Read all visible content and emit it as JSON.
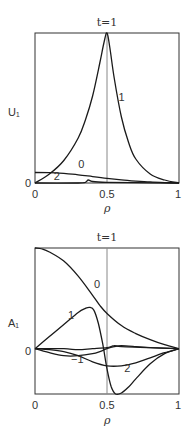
{
  "chart_data": [
    {
      "type": "line",
      "title": "t=1",
      "xlabel": "ρ",
      "ylabel": "U₁",
      "xlim": [
        0,
        1
      ],
      "ylim": [
        0,
        1
      ],
      "xticks": [
        "0",
        "0.5",
        "1"
      ],
      "yticks": [
        "0"
      ],
      "reference_line_x": 0.5,
      "grid": false,
      "series": [
        {
          "name": "1",
          "x": [
            0,
            0.1,
            0.2,
            0.3,
            0.35,
            0.4,
            0.45,
            0.48,
            0.5,
            0.52,
            0.55,
            0.6,
            0.65,
            0.7,
            0.8,
            0.9,
            1.0
          ],
          "y": [
            0,
            0.06,
            0.15,
            0.3,
            0.42,
            0.58,
            0.8,
            0.94,
            1.0,
            0.9,
            0.7,
            0.44,
            0.27,
            0.16,
            0.06,
            0.02,
            0
          ]
        },
        {
          "name": "0",
          "x": [
            0,
            0.1,
            0.2,
            0.3,
            0.4,
            0.5,
            0.6,
            0.7,
            0.8,
            0.9,
            1.0
          ],
          "y": [
            0.07,
            0.069,
            0.064,
            0.055,
            0.043,
            0.031,
            0.021,
            0.013,
            0.007,
            0.003,
            0
          ]
        },
        {
          "name": "2",
          "x": [
            0,
            0.3,
            0.35,
            0.37,
            0.4,
            0.5,
            0.7,
            1.0
          ],
          "y": [
            0,
            0,
            0.005,
            0.02,
            0.01,
            0.005,
            0.002,
            0
          ]
        }
      ],
      "annotations": [
        {
          "text": "1",
          "x": 0.58,
          "y": 0.55
        },
        {
          "text": "0",
          "x": 0.3,
          "y": 0.1
        },
        {
          "text": "2",
          "x": 0.13,
          "y": 0.02
        }
      ]
    },
    {
      "type": "line",
      "title": "t=1",
      "xlabel": "ρ",
      "ylabel": "A₁",
      "xlim": [
        0,
        1
      ],
      "ylim": [
        -0.45,
        1
      ],
      "xticks": [
        "0",
        "0.5",
        "1"
      ],
      "yticks": [
        "0"
      ],
      "reference_line_x": 0.5,
      "grid": false,
      "series": [
        {
          "name": "0",
          "x": [
            0,
            0.05,
            0.1,
            0.2,
            0.3,
            0.4,
            0.45,
            0.5,
            0.6,
            0.7,
            0.8,
            0.9,
            1.0
          ],
          "y": [
            1.0,
            0.99,
            0.96,
            0.87,
            0.72,
            0.53,
            0.43,
            0.35,
            0.23,
            0.15,
            0.09,
            0.04,
            0
          ]
        },
        {
          "name": "1",
          "x": [
            0,
            0.1,
            0.2,
            0.3,
            0.35,
            0.38,
            0.41,
            0.44,
            0.47,
            0.5,
            0.53,
            0.56,
            0.6,
            0.65,
            0.7,
            0.8,
            0.9,
            1.0
          ],
          "y": [
            0,
            0.12,
            0.24,
            0.36,
            0.4,
            0.41,
            0.38,
            0.25,
            0.05,
            -0.2,
            -0.38,
            -0.45,
            -0.44,
            -0.38,
            -0.3,
            -0.15,
            -0.05,
            0
          ]
        },
        {
          "name": "2",
          "x": [
            0,
            0.1,
            0.2,
            0.3,
            0.4,
            0.5,
            0.6,
            0.7,
            0.8,
            0.9,
            1.0
          ],
          "y": [
            0,
            -0.01,
            -0.03,
            -0.07,
            -0.13,
            -0.17,
            -0.17,
            -0.14,
            -0.09,
            -0.04,
            0
          ]
        },
        {
          "name": "-1",
          "x": [
            0,
            0.1,
            0.2,
            0.3,
            0.4,
            0.45,
            0.5,
            0.55,
            0.6,
            0.7,
            0.8,
            0.9,
            1.0
          ],
          "y": [
            0,
            -0.04,
            -0.07,
            -0.07,
            -0.05,
            -0.03,
            0,
            0.02,
            0.03,
            0.02,
            0.01,
            0.005,
            0
          ]
        },
        {
          "name": "flat",
          "x": [
            0,
            0.2,
            0.3,
            0.4,
            0.5,
            0.55,
            0.6,
            0.8,
            1.0
          ],
          "y": [
            0,
            0,
            -0.01,
            0,
            0.01,
            0.03,
            0.02,
            0.01,
            0
          ]
        }
      ],
      "annotations": [
        {
          "text": "0",
          "x": 0.41,
          "y": 0.6
        },
        {
          "text": "1",
          "x": 0.23,
          "y": 0.3
        },
        {
          "text": "-1",
          "x": 0.25,
          "y": -0.14
        },
        {
          "text": "2",
          "x": 0.62,
          "y": -0.23
        }
      ]
    }
  ]
}
